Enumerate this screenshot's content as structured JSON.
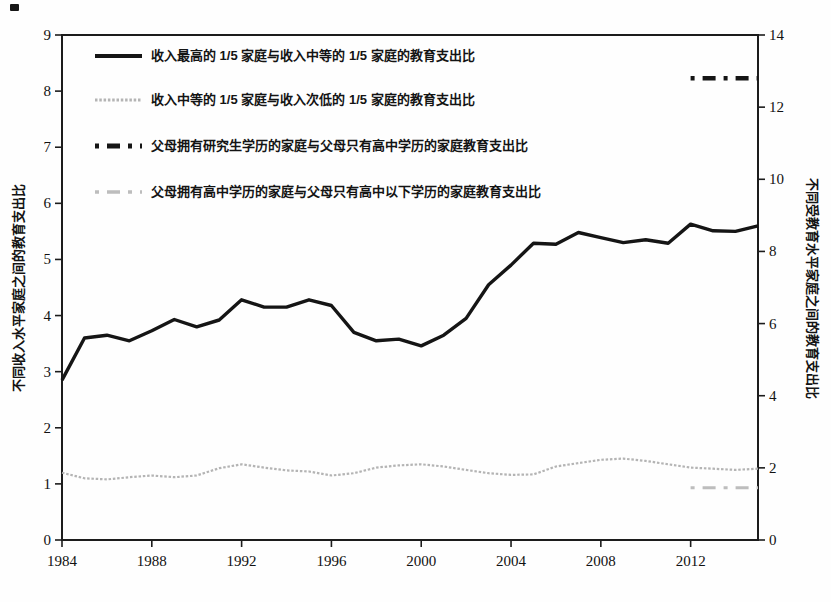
{
  "chart_data": {
    "type": "line",
    "title": "",
    "grid": false,
    "legend_position": "upper-left-inside",
    "x_axis": {
      "ticks": [
        1984,
        1988,
        1992,
        1996,
        2000,
        2004,
        2008,
        2012
      ],
      "range": [
        1984,
        2015
      ]
    },
    "left_axis": {
      "title": "不同收入水平家庭之间的教育支出比",
      "range": [
        0,
        9
      ],
      "ticks": [
        0,
        1,
        2,
        3,
        4,
        5,
        6,
        7,
        8,
        9
      ]
    },
    "right_axis": {
      "title": "不同受教育水平家庭之间的教育支出比",
      "range": [
        0,
        14
      ],
      "ticks": [
        0,
        2,
        4,
        6,
        8,
        10,
        12,
        14
      ]
    },
    "series": [
      {
        "name": "收入最高的 1/5 家庭与收入中等的 1/5 家庭的教育支出比",
        "axis": "left",
        "line": "solid",
        "color": "#151515",
        "width": 3.4,
        "x": [
          1984,
          1985,
          1986,
          1987,
          1988,
          1989,
          1990,
          1991,
          1992,
          1993,
          1994,
          1995,
          1996,
          1997,
          1998,
          1999,
          2000,
          2001,
          2002,
          2003,
          2004,
          2005,
          2006,
          2007,
          2008,
          2009,
          2010,
          2011,
          2012,
          2013,
          2014,
          2015
        ],
        "values": [
          2.85,
          3.6,
          3.65,
          3.55,
          3.73,
          3.93,
          3.8,
          3.92,
          4.28,
          4.15,
          4.15,
          4.28,
          4.18,
          3.7,
          3.55,
          3.58,
          3.46,
          3.65,
          3.95,
          4.55,
          4.9,
          5.29,
          5.27,
          5.48,
          5.39,
          5.3,
          5.35,
          5.29,
          5.63,
          5.51,
          5.5,
          5.6
        ]
      },
      {
        "name": "收入中等的 1/5 家庭与收入次低的 1/5 家庭的教育支出比",
        "axis": "left",
        "line": "dotted",
        "color": "#b4b4b4",
        "width": 2.2,
        "x": [
          1984,
          1985,
          1986,
          1987,
          1988,
          1989,
          1990,
          1991,
          1992,
          1993,
          1994,
          1995,
          1996,
          1997,
          1998,
          1999,
          2000,
          2001,
          2002,
          2003,
          2004,
          2005,
          2006,
          2007,
          2008,
          2009,
          2010,
          2011,
          2012,
          2013,
          2014,
          2015
        ],
        "values": [
          1.2,
          1.1,
          1.08,
          1.12,
          1.15,
          1.12,
          1.15,
          1.28,
          1.35,
          1.29,
          1.24,
          1.22,
          1.15,
          1.19,
          1.29,
          1.33,
          1.35,
          1.31,
          1.25,
          1.19,
          1.16,
          1.17,
          1.31,
          1.37,
          1.43,
          1.45,
          1.41,
          1.35,
          1.29,
          1.27,
          1.25,
          1.27
        ]
      },
      {
        "name": "父母拥有研究生学历的家庭与父母只有高中学历的家庭教育支出比",
        "axis": "right",
        "line": "dashed",
        "color": "#151515",
        "width": 4.5,
        "x": [
          2012,
          2015
        ],
        "values": [
          12.8,
          12.8
        ]
      },
      {
        "name": "父母拥有高中学历的家庭与父母只有高中以下学历的家庭教育支出比",
        "axis": "right",
        "line": "dashed",
        "color": "#bdbdbd",
        "width": 3,
        "x": [
          2012,
          2015
        ],
        "values": [
          1.45,
          1.45
        ]
      }
    ]
  }
}
